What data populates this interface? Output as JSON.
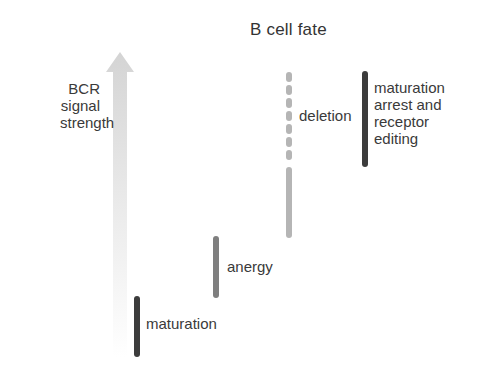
{
  "title": "B cell fate",
  "axis": {
    "label_lines": [
      "BCR",
      "signal",
      "strength"
    ],
    "arrow_color_top": "#d6d6d6",
    "arrow_color_bottom": "#ffffff"
  },
  "fates": [
    {
      "label": "maturation",
      "color": "#3c3c3c",
      "style": "solid"
    },
    {
      "label": "anergy",
      "color": "#7f7f7f",
      "style": "solid"
    },
    {
      "label": "deletion",
      "color": "#b5b5b5",
      "style": "dashed-then-solid"
    },
    {
      "label_lines": [
        "maturation",
        "arrest and",
        "receptor",
        "editing"
      ],
      "color": "#3c3c3c",
      "style": "solid"
    }
  ]
}
